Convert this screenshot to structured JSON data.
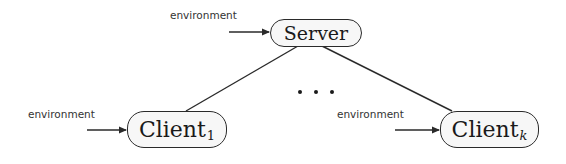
{
  "diagram": {
    "type": "client-server topology",
    "nodes": [
      {
        "id": "server",
        "label": "Server",
        "subscript": ""
      },
      {
        "id": "client1",
        "label": "Client",
        "subscript": "1"
      },
      {
        "id": "clientk",
        "label": "Client",
        "subscript": "k"
      }
    ],
    "inputs": [
      {
        "target": "server",
        "label": "environment"
      },
      {
        "target": "client1",
        "label": "environment"
      },
      {
        "target": "clientk",
        "label": "environment"
      }
    ],
    "edges": [
      {
        "from": "server",
        "to": "client1"
      },
      {
        "from": "server",
        "to": "clientk"
      }
    ],
    "ellipsis": "• • •",
    "colors": {
      "stroke": "#2a2a2a",
      "node_fill": "#f7f7f7",
      "label_text": "#333333"
    }
  }
}
